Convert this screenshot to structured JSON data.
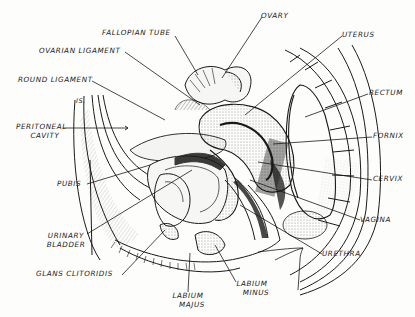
{
  "diagram": {
    "type": "anatomical-line-illustration",
    "colors": {
      "ink": "#1a1a1a",
      "paper": "#fdfdfc",
      "shade": "#2b2b2b"
    },
    "annotation": "IS.",
    "labels": {
      "fallopian_tube": "FALLOPIAN TUBE",
      "ovary": "OVARY",
      "ovarian_ligament": "OVARIAN LIGAMENT",
      "uterus": "UTERUS",
      "round_ligament": "ROUND LIGAMENT",
      "rectum": "RECTUM",
      "peritoneal_cavity_1": "PERITONEAL",
      "peritoneal_cavity_2": "CAVITY",
      "fornix": "FORNIX",
      "pubis": "PUBIS",
      "cervix": "CERVIX",
      "urinary_bladder_1": "URINARY",
      "urinary_bladder_2": "BLADDER",
      "vagina": "VAGINA",
      "urethra": "URETHRA",
      "glans_clitoridis": "GLANS CLITORIDIS",
      "labium_majus_1": "LABIUM",
      "labium_majus_2": "MAJUS",
      "labium_minus_1": "LABIUM",
      "labium_minus_2": "MINUS"
    }
  }
}
